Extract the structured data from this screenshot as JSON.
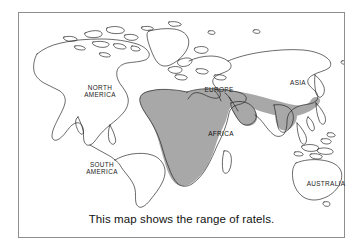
{
  "figure": {
    "kind": "world-map-range-illustration",
    "caption": "This map shows the range of ratels.",
    "frame_color": "#8e8e8e",
    "background_color": "#ffffff",
    "coastline_color": "#1a1a1a",
    "range_shade_color": "#a8a8a8"
  },
  "map": {
    "labels": {
      "north_america": "NORTH\nAMERICA",
      "south_america": "SOUTH\nAMERICA",
      "europe": "EUROPE",
      "asia": "ASIA",
      "africa": "AFRICA",
      "australia": "AUSTRALIA"
    },
    "range_description": "Shaded band covering sub-Saharan Africa and extending east across Arabia into the Indian subcontinent"
  }
}
